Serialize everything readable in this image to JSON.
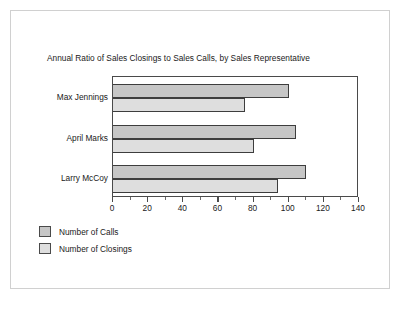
{
  "chart_data": {
    "type": "bar",
    "orientation": "horizontal",
    "title": "Annual Ratio of Sales Closings to Sales Calls, by Sales Representative",
    "categories": [
      "Max Jennings",
      "April Marks",
      "Larry McCoy"
    ],
    "series": [
      {
        "name": "Number of Calls",
        "values": [
          100,
          104,
          110
        ],
        "color": "#c6c6c6"
      },
      {
        "name": "Number of Closings",
        "values": [
          75,
          80,
          94
        ],
        "color": "#dedede"
      }
    ],
    "xlabel": "",
    "ylabel": "",
    "xlim": [
      0,
      140
    ],
    "xticks": [
      0,
      20,
      40,
      60,
      80,
      100,
      120,
      140
    ],
    "xtick_labels": [
      "0",
      "20",
      "40",
      "60",
      "80",
      "100",
      "120",
      "140"
    ],
    "minor_tick_step": 10,
    "grid": false,
    "legend_position": "below-left"
  },
  "legend": {
    "items": [
      {
        "label": "Number of Calls",
        "color": "#c6c6c6"
      },
      {
        "label": "Number of Closings",
        "color": "#dedede"
      }
    ]
  }
}
